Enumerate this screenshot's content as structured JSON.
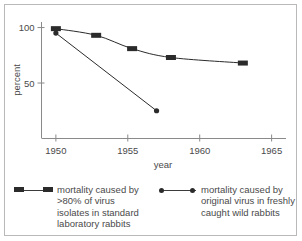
{
  "chart_data": {
    "type": "line",
    "title": "",
    "xlabel": "year",
    "ylabel": "percent",
    "xlim": [
      1949,
      1966
    ],
    "ylim": [
      0,
      105
    ],
    "xticks": [
      1950,
      1955,
      1960,
      1965
    ],
    "xtick_labels": [
      "1950",
      "1955",
      "1960",
      "1965"
    ],
    "yticks": [
      50,
      100
    ],
    "ytick_labels": [
      "50",
      "100"
    ],
    "grid": false,
    "legend_position": "below",
    "series": [
      {
        "name": "mortality caused by >80% of virus isolates in standard laboratory rabbits",
        "marker": "square",
        "color": "#2b2b2b",
        "points": [
          {
            "x": 1950.0,
            "y": 99
          },
          {
            "x": 1952.8,
            "y": 93
          },
          {
            "x": 1955.3,
            "y": 81
          },
          {
            "x": 1958.0,
            "y": 73
          },
          {
            "x": 1963.0,
            "y": 68
          }
        ]
      },
      {
        "name": "mortality caused by original virus in freshly caught wild rabbits",
        "marker": "circle",
        "color": "#2b2b2b",
        "points": [
          {
            "x": 1950.0,
            "y": 95
          },
          {
            "x": 1957.0,
            "y": 25
          }
        ]
      }
    ]
  },
  "axes": {
    "y_axis_label": "percent",
    "x_axis_label": "year"
  },
  "legend": {
    "entries": [
      {
        "marker": "square-line",
        "label": "mortality caused by\n>80% of virus\nisolates in standard\nlaboratory rabbits"
      },
      {
        "marker": "dot-line",
        "label": "mortality caused by\noriginal virus in freshly\ncaught wild rabbits"
      }
    ]
  },
  "colors": {
    "ink": "#2b2b2b",
    "text": "#4a4a4a",
    "axis": "#8a8a8a",
    "frame": "#b9b9b9",
    "background": "#ffffff"
  }
}
